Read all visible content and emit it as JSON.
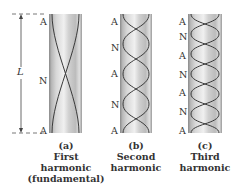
{
  "figure": {
    "length_label": "L",
    "tubes": [
      {
        "id": "a",
        "letter": "(a)",
        "caption_lines": [
          "First",
          "harmonic",
          "(fundamental)"
        ],
        "node_labels": [
          "A",
          "N",
          "A"
        ],
        "half_wavelengths": 1
      },
      {
        "id": "b",
        "letter": "(b)",
        "caption_lines": [
          "Second",
          "harmonic"
        ],
        "node_labels": [
          "A",
          "N",
          "A",
          "N",
          "A"
        ],
        "half_wavelengths": 2
      },
      {
        "id": "c",
        "letter": "(c)",
        "caption_lines": [
          "Third",
          "harmonic"
        ],
        "node_labels": [
          "A",
          "N",
          "A",
          "N",
          "A",
          "N",
          "A"
        ],
        "half_wavelengths": 3
      }
    ],
    "legend": {
      "A": "Antinode",
      "N": "Node"
    },
    "colors": {
      "tube_light": "#e6e6e6",
      "tube_dark": "#8f8f8f",
      "wave": "#3a3a3a",
      "dashed": "#555555"
    }
  }
}
